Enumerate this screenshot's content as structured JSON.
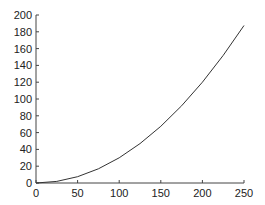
{
  "chart_data": {
    "type": "line",
    "title": "",
    "xlabel": "",
    "ylabel": "",
    "xlim": [
      0,
      250
    ],
    "ylim": [
      0,
      200
    ],
    "grid": false,
    "legend": null,
    "x_ticks": [
      0,
      50,
      100,
      150,
      200,
      250
    ],
    "y_ticks": [
      0,
      20,
      40,
      60,
      80,
      100,
      120,
      140,
      160,
      180,
      200
    ],
    "series": [
      {
        "name": "curve",
        "color": "#333333",
        "x": [
          0,
          25,
          50,
          75,
          100,
          125,
          150,
          175,
          200,
          225,
          250
        ],
        "y": [
          0,
          1.9,
          7.5,
          16.9,
          30,
          46.9,
          67.5,
          91.9,
          120,
          151.9,
          187.5
        ]
      }
    ]
  }
}
